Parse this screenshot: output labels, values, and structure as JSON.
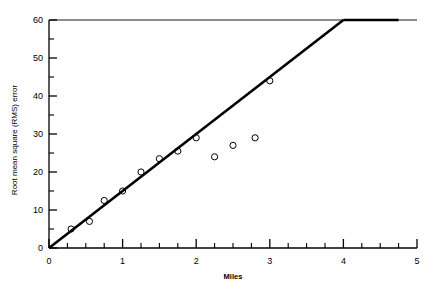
{
  "chart_data": {
    "type": "scatter",
    "title": "",
    "xlabel": "Miles",
    "ylabel": "Root mean square (RMS) error",
    "xlim": [
      0,
      5
    ],
    "ylim": [
      0,
      60
    ],
    "grid": false,
    "legend": null,
    "x_major_ticks": [
      0,
      1,
      2,
      3,
      4,
      5
    ],
    "x_tick_labels": [
      "0",
      "1",
      "2",
      "3",
      "4",
      "5"
    ],
    "x_minor_step": 0.25,
    "y_major_ticks": [
      0,
      10,
      20,
      30,
      40,
      50,
      60
    ],
    "y_tick_labels": [
      "0",
      "10",
      "20",
      "30",
      "40",
      "50",
      "60"
    ],
    "y_minor_step": 5,
    "series": [
      {
        "name": "observations",
        "marker": "open-circle",
        "points": [
          {
            "x": 0.3,
            "y": 5.0
          },
          {
            "x": 0.55,
            "y": 7.0
          },
          {
            "x": 0.75,
            "y": 12.5
          },
          {
            "x": 1.0,
            "y": 15.0
          },
          {
            "x": 1.25,
            "y": 20.0
          },
          {
            "x": 1.5,
            "y": 23.5
          },
          {
            "x": 1.75,
            "y": 25.5
          },
          {
            "x": 2.0,
            "y": 29.0
          },
          {
            "x": 2.25,
            "y": 24.0
          },
          {
            "x": 2.5,
            "y": 27.0
          },
          {
            "x": 2.8,
            "y": 29.0
          },
          {
            "x": 3.0,
            "y": 44.0
          }
        ]
      }
    ],
    "fit_line": {
      "name": "fitted-line",
      "segments": [
        {
          "x1": 0.0,
          "y1": 0.0,
          "x2": 4.0,
          "y2": 60.0
        },
        {
          "x1": 4.0,
          "y1": 60.0,
          "x2": 4.75,
          "y2": 60.0
        }
      ],
      "slope": 15.0,
      "intercept": 0.0
    },
    "reference_line": {
      "name": "ceiling-line",
      "y": 60.0,
      "x_from": 0.0,
      "x_to": 5.0
    }
  }
}
